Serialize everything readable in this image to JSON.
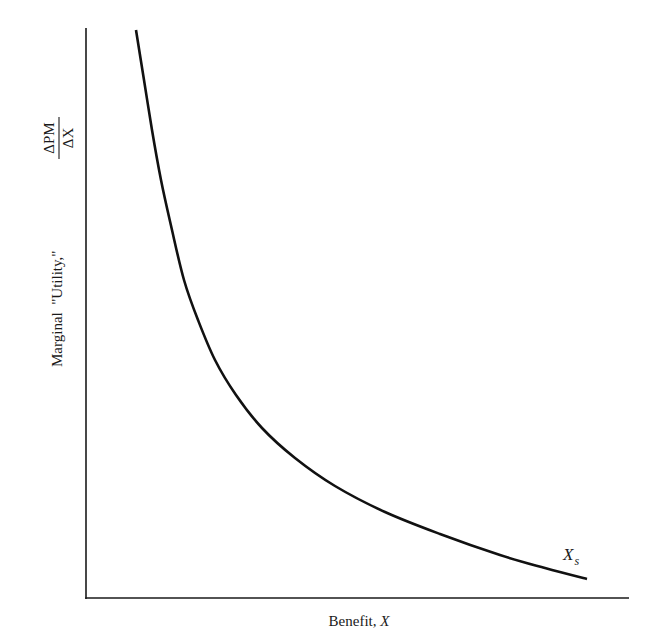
{
  "chart_data": {
    "type": "line",
    "title": "",
    "xlabel": "Benefit, X",
    "xlabel_parts": {
      "text": "Benefit, ",
      "var": "X"
    },
    "ylabel": "Marginal \"Utility,\" ΔPM/ΔX",
    "ylabel_parts": {
      "text": "Marginal  \"Utility,\"",
      "numerator": "ΔPM",
      "denominator": "ΔX"
    },
    "grid": false,
    "legend": null,
    "axis_ticks": "none",
    "series": [
      {
        "name": "Marginal utility curve",
        "description": "Convex, monotonically decreasing curve (diminishing marginal utility) that approaches the x-axis as benefit X increases",
        "points_px": [
          [
            136,
            30
          ],
          [
            144,
            80
          ],
          [
            152,
            130
          ],
          [
            161,
            180
          ],
          [
            172,
            230
          ],
          [
            184,
            280
          ],
          [
            198,
            320
          ],
          [
            215,
            360
          ],
          [
            236,
            395
          ],
          [
            262,
            428
          ],
          [
            295,
            458
          ],
          [
            335,
            486
          ],
          [
            385,
            512
          ],
          [
            440,
            534
          ],
          [
            500,
            555
          ],
          [
            545,
            568
          ],
          [
            587,
            579
          ]
        ],
        "x": [
          0.09,
          0.11,
          0.12,
          0.14,
          0.16,
          0.18,
          0.21,
          0.24,
          0.28,
          0.33,
          0.39,
          0.46,
          0.55,
          0.65,
          0.76,
          0.84,
          0.92
        ],
        "y": [
          1.0,
          0.91,
          0.82,
          0.73,
          0.65,
          0.56,
          0.49,
          0.42,
          0.36,
          0.3,
          0.25,
          0.2,
          0.15,
          0.11,
          0.08,
          0.05,
          0.03
        ]
      }
    ],
    "annotations": [
      {
        "text": "X",
        "subscript": "s",
        "position": "near curve end (lower right)",
        "meaning": "saturation benefit level"
      }
    ],
    "xlim": [
      0,
      1
    ],
    "ylim": [
      0,
      1
    ]
  },
  "labels": {
    "x_axis_text": "Benefit, ",
    "x_axis_var": "X",
    "y_axis_text": "Marginal  \"Utility,\"",
    "y_frac_num": "ΔPM",
    "y_frac_den": "ΔX",
    "annot_main": "X",
    "annot_sub": "s"
  },
  "colors": {
    "ink": "#1a1a1a",
    "background": "#ffffff"
  }
}
